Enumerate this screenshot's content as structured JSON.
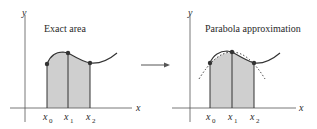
{
  "left_panel": {
    "title": "Exact area",
    "y_axis_label": "y",
    "x_axis_label": "x",
    "ticks": [
      {
        "base": "x",
        "sub": "0"
      },
      {
        "base": "x",
        "sub": "1"
      },
      {
        "base": "x",
        "sub": "2"
      }
    ]
  },
  "right_panel": {
    "title": "Parabola approximation",
    "y_axis_label": "y",
    "x_axis_label": "x",
    "ticks": [
      {
        "base": "x",
        "sub": "0"
      },
      {
        "base": "x",
        "sub": "1"
      },
      {
        "base": "x",
        "sub": "2"
      }
    ]
  },
  "colors": {
    "shade": "#cfcfcf",
    "stroke": "#333333",
    "axis": "#444444"
  }
}
